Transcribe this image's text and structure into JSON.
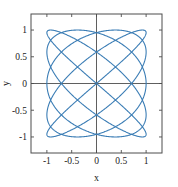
{
  "figure": {
    "background_color": "#ffffff",
    "axes_box": {
      "left": 31,
      "top": 14,
      "right": 162,
      "bottom": 153
    }
  },
  "chart_data": {
    "type": "line",
    "title": "",
    "subtitle": "",
    "xlabel": "x",
    "ylabel": "y",
    "xlim": [
      -1.32,
      1.32
    ],
    "ylim": [
      -1.3,
      1.3
    ],
    "xticks": [
      -1,
      -0.5,
      0,
      0.5,
      1
    ],
    "xticklabels": [
      "-1",
      "-0.5",
      "0",
      "0.5",
      "1"
    ],
    "yticks": [
      -1,
      -0.5,
      0,
      0.5,
      1
    ],
    "yticklabels": [
      "-1",
      "-0.5",
      "0",
      "0.5",
      "1"
    ],
    "grid": false,
    "legend": null,
    "legend_position": "none",
    "box": true,
    "tick_direction": "in",
    "zero_lines": true,
    "series": [
      {
        "name": "lissajous",
        "curve_type": "lissajous",
        "color": "#3b7db5",
        "line_width": 1.1,
        "parametric": {
          "x_expression": "sin(5*t)",
          "y_expression": "sin(4*t)",
          "freq_x": 5,
          "freq_y": 4,
          "amplitude_x": 1,
          "amplitude_y": 1,
          "phase": 0,
          "t_start": 0,
          "t_end": 6.283185307179586,
          "samples": 2000
        },
        "lobes_horizontal": 5,
        "lobes_vertical": 4,
        "x_range": [
          -1,
          1
        ],
        "y_range": [
          -1,
          1
        ]
      }
    ],
    "axis_color": "#4d4d4d",
    "zero_line_color": "#4d4d4d",
    "text_color": "#1a1a1a"
  }
}
